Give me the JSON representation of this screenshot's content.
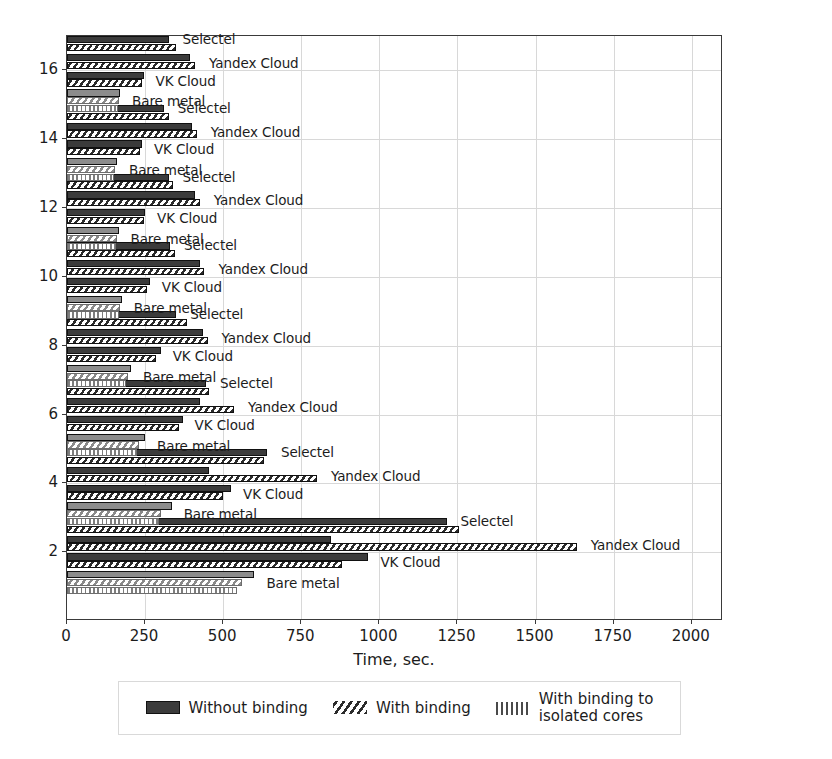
{
  "chart_data": {
    "type": "bar",
    "orientation": "horizontal",
    "title": "",
    "xlabel": "Time, sec.",
    "ylabel": "",
    "xlim": [
      0,
      2100
    ],
    "ylim": [
      0,
      17
    ],
    "xticks": [
      0,
      250,
      500,
      750,
      1000,
      1250,
      1500,
      1750,
      2000
    ],
    "yticks": [
      2,
      4,
      6,
      8,
      10,
      12,
      14,
      16
    ],
    "grid": true,
    "legend_position": "below-axes",
    "legend": [
      {
        "label": "Without binding",
        "pattern": "solid"
      },
      {
        "label": "With binding",
        "pattern": "diagonal-hatch"
      },
      {
        "label": "With binding to\nisolated cores",
        "pattern": "vertical-hatch"
      }
    ],
    "group_labels": [
      "Selectel",
      "Yandex Cloud",
      "VK Cloud",
      "Bare metal"
    ],
    "groups": [
      {
        "threads": 2,
        "providers": [
          {
            "name": "Selectel",
            "without_binding": 1215,
            "with_binding": 1255,
            "isolated_cores": null
          },
          {
            "name": "Yandex Cloud",
            "without_binding": 845,
            "with_binding": 1632,
            "isolated_cores": null
          },
          {
            "name": "VK Cloud",
            "without_binding": 965,
            "with_binding": 880,
            "isolated_cores": null
          },
          {
            "name": "Bare metal",
            "without_binding": 600,
            "with_binding": 560,
            "isolated_cores": 545
          }
        ]
      },
      {
        "threads": 4,
        "providers": [
          {
            "name": "Selectel",
            "without_binding": 640,
            "with_binding": 630,
            "isolated_cores": null
          },
          {
            "name": "Yandex Cloud",
            "without_binding": 455,
            "with_binding": 800,
            "isolated_cores": null
          },
          {
            "name": "VK Cloud",
            "without_binding": 525,
            "with_binding": 500,
            "isolated_cores": null
          },
          {
            "name": "Bare metal",
            "without_binding": 335,
            "with_binding": 300,
            "isolated_cores": 295
          }
        ]
      },
      {
        "threads": 6,
        "providers": [
          {
            "name": "Selectel",
            "without_binding": 445,
            "with_binding": 455,
            "isolated_cores": null
          },
          {
            "name": "Yandex Cloud",
            "without_binding": 425,
            "with_binding": 535,
            "isolated_cores": null
          },
          {
            "name": "VK Cloud",
            "without_binding": 370,
            "with_binding": 360,
            "isolated_cores": null
          },
          {
            "name": "Bare metal",
            "without_binding": 250,
            "with_binding": 230,
            "isolated_cores": 225
          }
        ]
      },
      {
        "threads": 8,
        "providers": [
          {
            "name": "Selectel",
            "without_binding": 350,
            "with_binding": 385,
            "isolated_cores": null
          },
          {
            "name": "Yandex Cloud",
            "without_binding": 435,
            "with_binding": 450,
            "isolated_cores": null
          },
          {
            "name": "VK Cloud",
            "without_binding": 300,
            "with_binding": 285,
            "isolated_cores": null
          },
          {
            "name": "Bare metal",
            "without_binding": 205,
            "with_binding": 195,
            "isolated_cores": 190
          }
        ]
      },
      {
        "threads": 10,
        "providers": [
          {
            "name": "Selectel",
            "without_binding": 330,
            "with_binding": 345,
            "isolated_cores": null
          },
          {
            "name": "Yandex Cloud",
            "without_binding": 425,
            "with_binding": 440,
            "isolated_cores": null
          },
          {
            "name": "VK Cloud",
            "without_binding": 265,
            "with_binding": 255,
            "isolated_cores": null
          },
          {
            "name": "Bare metal",
            "without_binding": 175,
            "with_binding": 170,
            "isolated_cores": 168
          }
        ]
      },
      {
        "threads": 12,
        "providers": [
          {
            "name": "Selectel",
            "without_binding": 325,
            "with_binding": 340,
            "isolated_cores": null
          },
          {
            "name": "Yandex Cloud",
            "without_binding": 410,
            "with_binding": 425,
            "isolated_cores": null
          },
          {
            "name": "VK Cloud",
            "without_binding": 250,
            "with_binding": 245,
            "isolated_cores": null
          },
          {
            "name": "Bare metal",
            "without_binding": 165,
            "with_binding": 160,
            "isolated_cores": 158
          }
        ]
      },
      {
        "threads": 14,
        "providers": [
          {
            "name": "Selectel",
            "without_binding": 310,
            "with_binding": 325,
            "isolated_cores": null
          },
          {
            "name": "Yandex Cloud",
            "without_binding": 400,
            "with_binding": 415,
            "isolated_cores": null
          },
          {
            "name": "VK Cloud",
            "without_binding": 240,
            "with_binding": 235,
            "isolated_cores": null
          },
          {
            "name": "Bare metal",
            "without_binding": 160,
            "with_binding": 155,
            "isolated_cores": 152
          }
        ]
      },
      {
        "threads": 16,
        "providers": [
          {
            "name": "Selectel",
            "without_binding": 325,
            "with_binding": 350,
            "isolated_cores": null
          },
          {
            "name": "Yandex Cloud",
            "without_binding": 395,
            "with_binding": 410,
            "isolated_cores": null
          },
          {
            "name": "VK Cloud",
            "without_binding": 245,
            "with_binding": 240,
            "isolated_cores": null
          },
          {
            "name": "Bare metal",
            "without_binding": 170,
            "with_binding": 165,
            "isolated_cores": 162
          }
        ]
      }
    ]
  },
  "colors": {
    "solid": "#3b3b3b",
    "hatch": "#2b2b2b",
    "vhatch": "#7d7d7d",
    "grid": "#d8d8d8",
    "frame": "#3a3a3a",
    "text": "#1c1c1c",
    "background": "#ffffff"
  }
}
